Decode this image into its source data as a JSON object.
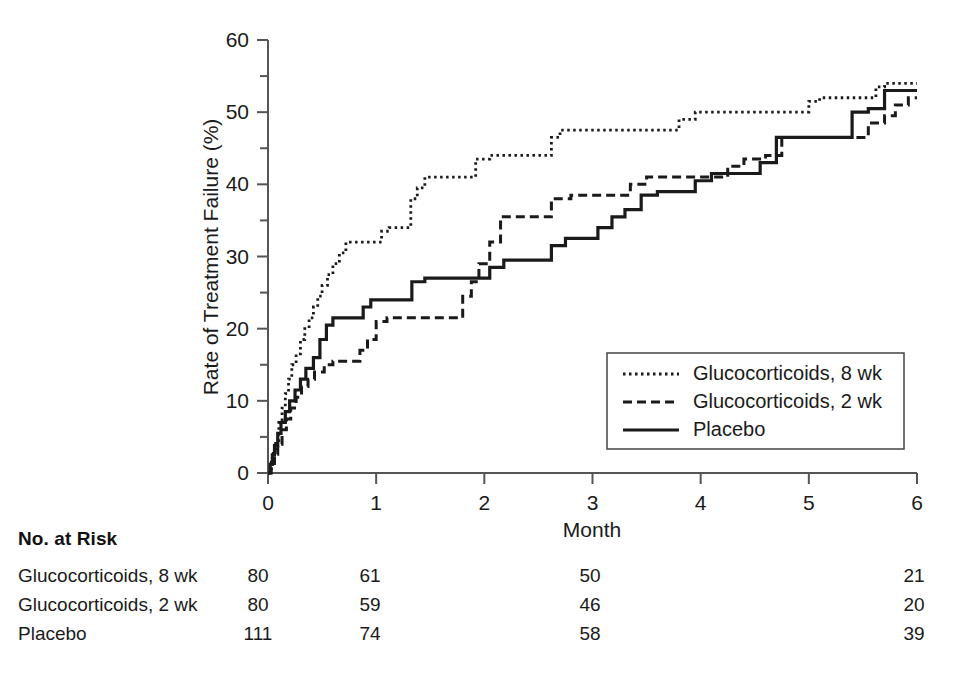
{
  "chart_data": {
    "type": "line",
    "title": "",
    "xlabel": "Month",
    "ylabel": "Rate of Treatment Failure (%)",
    "xlim": [
      0,
      6
    ],
    "ylim": [
      0,
      60
    ],
    "xticks": [
      "0",
      "1",
      "2",
      "3",
      "4",
      "5",
      "6"
    ],
    "yticks": [
      "0",
      "10",
      "20",
      "30",
      "40",
      "50",
      "60"
    ],
    "yminor_ticks": [
      5,
      15,
      25,
      35,
      45,
      55
    ],
    "grid": false,
    "legend_position": "center-right",
    "series": [
      {
        "name": "Glucocorticoids, 8 wk",
        "style": "dotted",
        "points": [
          [
            0.0,
            0.0
          ],
          [
            0.03,
            1.5
          ],
          [
            0.05,
            3.0
          ],
          [
            0.07,
            4.5
          ],
          [
            0.1,
            7.0
          ],
          [
            0.13,
            9.0
          ],
          [
            0.16,
            11.0
          ],
          [
            0.19,
            13.0
          ],
          [
            0.22,
            15.0
          ],
          [
            0.26,
            16.5
          ],
          [
            0.3,
            18.5
          ],
          [
            0.34,
            20.0
          ],
          [
            0.38,
            21.5
          ],
          [
            0.42,
            23.0
          ],
          [
            0.46,
            24.5
          ],
          [
            0.5,
            26.0
          ],
          [
            0.55,
            27.5
          ],
          [
            0.6,
            29.0
          ],
          [
            0.66,
            30.5
          ],
          [
            0.72,
            32.0
          ],
          [
            0.8,
            32.0
          ],
          [
            1.0,
            32.0
          ],
          [
            1.05,
            33.5
          ],
          [
            1.12,
            34.0
          ],
          [
            1.25,
            34.0
          ],
          [
            1.32,
            38.0
          ],
          [
            1.38,
            39.5
          ],
          [
            1.45,
            41.0
          ],
          [
            1.6,
            41.0
          ],
          [
            1.85,
            41.0
          ],
          [
            1.92,
            43.5
          ],
          [
            2.05,
            44.0
          ],
          [
            2.3,
            44.0
          ],
          [
            2.55,
            44.0
          ],
          [
            2.62,
            46.5
          ],
          [
            2.7,
            47.5
          ],
          [
            2.9,
            47.5
          ],
          [
            3.2,
            47.5
          ],
          [
            3.5,
            47.5
          ],
          [
            3.72,
            47.5
          ],
          [
            3.8,
            49.0
          ],
          [
            3.95,
            50.0
          ],
          [
            4.3,
            50.0
          ],
          [
            4.6,
            50.0
          ],
          [
            4.85,
            50.0
          ],
          [
            5.0,
            51.5
          ],
          [
            5.1,
            52.0
          ],
          [
            5.35,
            52.0
          ],
          [
            5.55,
            52.0
          ],
          [
            5.62,
            53.5
          ],
          [
            5.7,
            54.0
          ],
          [
            6.0,
            54.0
          ]
        ]
      },
      {
        "name": "Glucocorticoids, 2 wk",
        "style": "dashed",
        "points": [
          [
            0.0,
            0.0
          ],
          [
            0.03,
            1.3
          ],
          [
            0.06,
            2.6
          ],
          [
            0.09,
            4.0
          ],
          [
            0.13,
            6.0
          ],
          [
            0.17,
            7.5
          ],
          [
            0.21,
            9.0
          ],
          [
            0.26,
            10.5
          ],
          [
            0.31,
            12.0
          ],
          [
            0.37,
            13.0
          ],
          [
            0.43,
            14.0
          ],
          [
            0.52,
            15.0
          ],
          [
            0.6,
            15.5
          ],
          [
            0.7,
            15.5
          ],
          [
            0.8,
            15.5
          ],
          [
            0.85,
            17.0
          ],
          [
            0.92,
            18.5
          ],
          [
            1.0,
            21.0
          ],
          [
            1.1,
            21.5
          ],
          [
            1.25,
            21.5
          ],
          [
            1.4,
            21.5
          ],
          [
            1.55,
            21.5
          ],
          [
            1.7,
            21.5
          ],
          [
            1.8,
            24.5
          ],
          [
            1.88,
            26.5
          ],
          [
            1.95,
            29.0
          ],
          [
            2.05,
            32.0
          ],
          [
            2.15,
            35.5
          ],
          [
            2.3,
            35.5
          ],
          [
            2.5,
            35.5
          ],
          [
            2.62,
            38.0
          ],
          [
            2.8,
            38.5
          ],
          [
            3.0,
            38.5
          ],
          [
            3.25,
            38.5
          ],
          [
            3.35,
            40.0
          ],
          [
            3.5,
            41.0
          ],
          [
            3.7,
            41.0
          ],
          [
            3.95,
            41.0
          ],
          [
            4.1,
            41.0
          ],
          [
            4.25,
            42.5
          ],
          [
            4.4,
            43.5
          ],
          [
            4.6,
            44.0
          ],
          [
            4.75,
            46.5
          ],
          [
            4.9,
            46.5
          ],
          [
            5.2,
            46.5
          ],
          [
            5.45,
            46.5
          ],
          [
            5.55,
            48.5
          ],
          [
            5.7,
            49.5
          ],
          [
            5.8,
            51.0
          ],
          [
            5.92,
            52.0
          ],
          [
            6.0,
            52.0
          ]
        ]
      },
      {
        "name": "Placebo",
        "style": "solid",
        "points": [
          [
            0.0,
            0.0
          ],
          [
            0.02,
            1.2
          ],
          [
            0.04,
            2.5
          ],
          [
            0.06,
            3.8
          ],
          [
            0.09,
            5.5
          ],
          [
            0.12,
            7.0
          ],
          [
            0.16,
            8.5
          ],
          [
            0.2,
            10.0
          ],
          [
            0.25,
            11.5
          ],
          [
            0.3,
            13.0
          ],
          [
            0.35,
            14.5
          ],
          [
            0.42,
            16.0
          ],
          [
            0.48,
            18.5
          ],
          [
            0.54,
            20.5
          ],
          [
            0.6,
            21.5
          ],
          [
            0.7,
            21.5
          ],
          [
            0.8,
            21.5
          ],
          [
            0.88,
            23.0
          ],
          [
            0.95,
            24.0
          ],
          [
            1.05,
            24.0
          ],
          [
            1.2,
            24.0
          ],
          [
            1.3,
            24.0
          ],
          [
            1.33,
            26.5
          ],
          [
            1.45,
            27.0
          ],
          [
            1.6,
            27.0
          ],
          [
            1.8,
            27.0
          ],
          [
            1.95,
            27.0
          ],
          [
            2.05,
            28.5
          ],
          [
            2.18,
            29.5
          ],
          [
            2.35,
            29.5
          ],
          [
            2.5,
            29.5
          ],
          [
            2.62,
            31.5
          ],
          [
            2.75,
            32.5
          ],
          [
            2.9,
            32.5
          ],
          [
            3.05,
            34.0
          ],
          [
            3.18,
            35.5
          ],
          [
            3.3,
            36.5
          ],
          [
            3.45,
            38.5
          ],
          [
            3.6,
            39.0
          ],
          [
            3.8,
            39.0
          ],
          [
            3.95,
            40.5
          ],
          [
            4.1,
            41.5
          ],
          [
            4.3,
            41.5
          ],
          [
            4.45,
            41.5
          ],
          [
            4.55,
            43.0
          ],
          [
            4.7,
            46.5
          ],
          [
            4.9,
            46.5
          ],
          [
            5.1,
            46.5
          ],
          [
            5.3,
            46.5
          ],
          [
            5.4,
            50.0
          ],
          [
            5.55,
            50.5
          ],
          [
            5.7,
            53.0
          ],
          [
            5.85,
            53.0
          ],
          [
            6.0,
            53.0
          ]
        ]
      }
    ]
  },
  "legend": {
    "items": [
      {
        "label": "Glucocorticoids, 8 wk",
        "style": "dotted"
      },
      {
        "label": "Glucocorticoids, 2 wk",
        "style": "dashed"
      },
      {
        "label": "Placebo",
        "style": "solid"
      }
    ]
  },
  "risk_table": {
    "title": "No. at Risk",
    "rows": [
      {
        "label": "Glucocorticoids, 8 wk",
        "values": [
          "80",
          "61",
          "50",
          "21"
        ]
      },
      {
        "label": "Glucocorticoids, 2 wk",
        "values": [
          "80",
          "59",
          "46",
          "20"
        ]
      },
      {
        "label": "Placebo",
        "values": [
          "111",
          "74",
          "58",
          "39"
        ]
      }
    ]
  },
  "colors": {
    "ink": "#1a1a1a",
    "axis": "#555555",
    "background": "#ffffff"
  }
}
